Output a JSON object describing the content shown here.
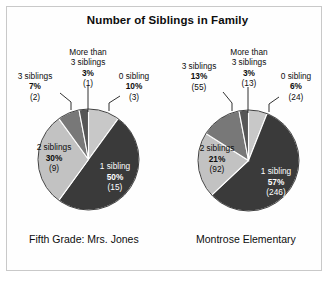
{
  "chart_data": [
    {
      "type": "pie",
      "title": "Number of Siblings in Family",
      "caption": "Fifth Grade: Mrs. Jones",
      "categories": [
        "0 sibling",
        "1 sibling",
        "2 siblings",
        "3 siblings",
        "More than 3 siblings"
      ],
      "values": [
        10,
        50,
        30,
        7,
        3
      ],
      "counts": [
        3,
        15,
        9,
        2,
        1
      ],
      "percent_labels": [
        "10%",
        "50%",
        "30%",
        "7%",
        "3%"
      ],
      "count_labels": [
        "(3)",
        "(15)",
        "(9)",
        "(2)",
        "(1)"
      ],
      "slice_colors": [
        "#c8c8c8",
        "#3a3a3a",
        "#c2c2c2",
        "#787878",
        "#565656"
      ],
      "legend": "none",
      "grid": false
    },
    {
      "type": "pie",
      "title": "Number of Siblings in Family",
      "caption": "Montrose Elementary",
      "categories": [
        "0 sibling",
        "1 sibling",
        "2 siblings",
        "3 siblings",
        "More than 3 siblings"
      ],
      "values": [
        6,
        57,
        21,
        13,
        3
      ],
      "counts": [
        24,
        246,
        92,
        55,
        13
      ],
      "percent_labels": [
        "6%",
        "57%",
        "21%",
        "13%",
        "3%"
      ],
      "count_labels": [
        "(24)",
        "(246)",
        "(92)",
        "(55)",
        "(13)"
      ],
      "slice_colors": [
        "#c8c8c8",
        "#3a3a3a",
        "#c2c2c2",
        "#787878",
        "#565656"
      ],
      "legend": "none",
      "grid": false
    }
  ],
  "title": "Number of Siblings in Family",
  "left": {
    "caption": "Fifth Grade: Mrs. Jones",
    "more_than_name_line1": "More than",
    "more_than_name_line2": "3 siblings",
    "more_than_pct": "3%",
    "more_than_cnt": "(1)",
    "three_name": "3 siblings",
    "three_pct": "7%",
    "three_cnt": "(2)",
    "zero_name": "0 sibling",
    "zero_pct": "10%",
    "zero_cnt": "(3)",
    "two_name": "2 siblings",
    "two_pct": "30%",
    "two_cnt": "(9)",
    "one_name": "1 sibling",
    "one_pct": "50%",
    "one_cnt": "(15)"
  },
  "right": {
    "caption": "Montrose Elementary",
    "more_than_name_line1": "More than",
    "more_than_name_line2": "3 siblings",
    "more_than_pct": "3%",
    "more_than_cnt": "(13)",
    "three_name": "3 siblings",
    "three_pct": "13%",
    "three_cnt": "(55)",
    "zero_name": "0 sibling",
    "zero_pct": "6%",
    "zero_cnt": "(24)",
    "two_name": "2 siblings",
    "two_pct": "21%",
    "two_cnt": "(92)",
    "one_name": "1 sibling",
    "one_pct": "57%",
    "one_cnt": "(246)"
  }
}
